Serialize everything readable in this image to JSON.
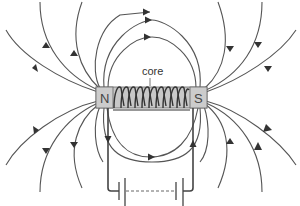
{
  "diagram": {
    "labels": {
      "core": "core",
      "north_pole": "N",
      "south_pole": "S"
    },
    "components": [
      {
        "name": "solenoid-coil",
        "turns": 11
      },
      {
        "name": "core-bar"
      },
      {
        "name": "battery"
      },
      {
        "name": "connecting-wires"
      }
    ],
    "field_lines": {
      "count_top_outer": 6,
      "count_bottom_outer": 6,
      "inner_loops": 2,
      "direction": "N to S outside the coil"
    },
    "colors": {
      "lines": "#555555",
      "core_fill": "#c8c8c8",
      "background": "#ffffff"
    }
  }
}
